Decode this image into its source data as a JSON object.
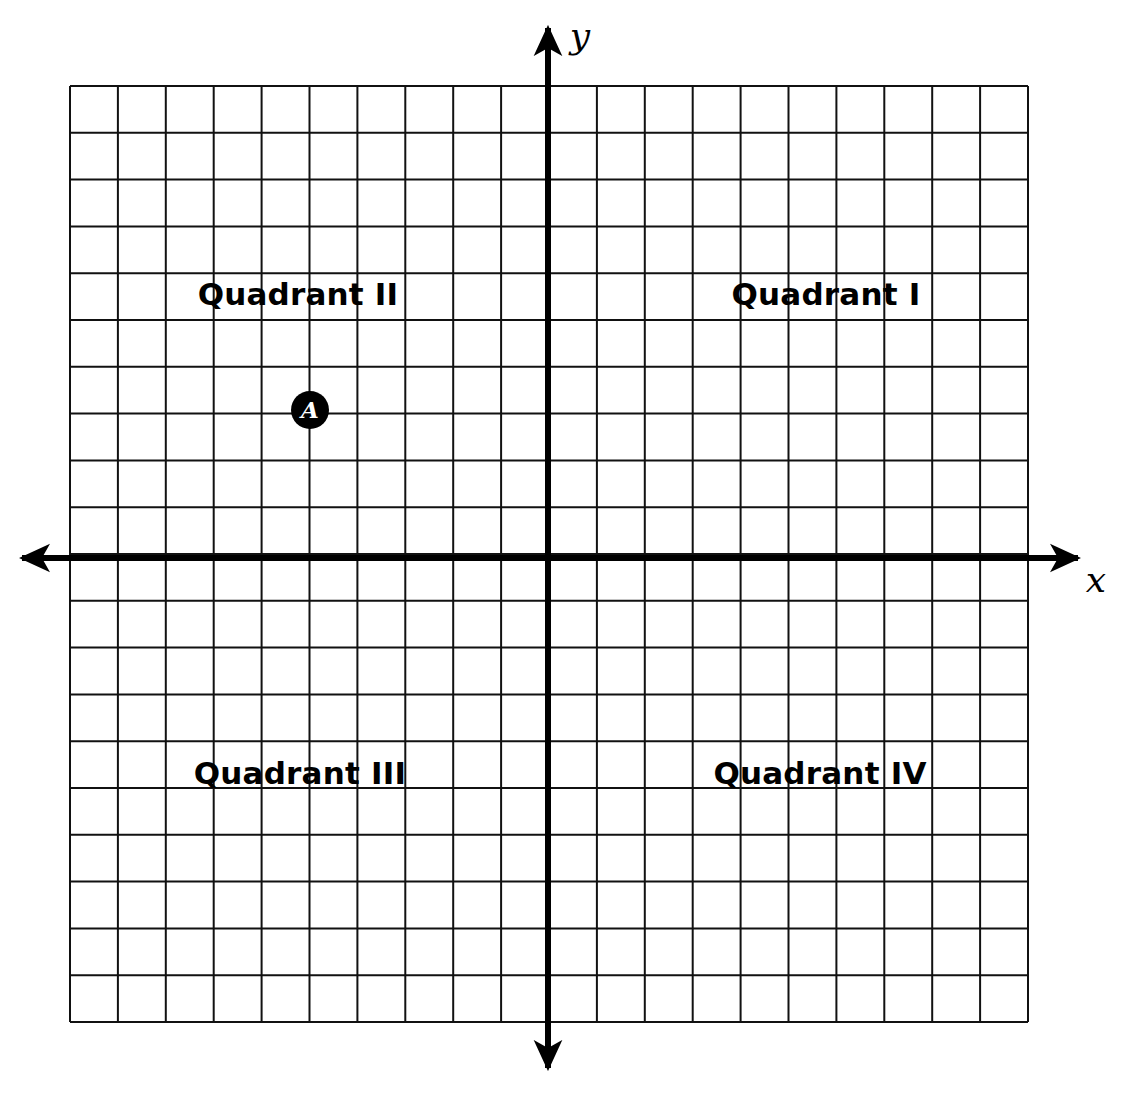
{
  "figure": {
    "type": "coordinate-plane",
    "background_color": "#ffffff",
    "ink_color": "#000000",
    "grid": {
      "left_px": 70,
      "top_px": 86,
      "right_px": 1028,
      "bottom_px": 1022,
      "columns": 20,
      "rows": 20,
      "cell_width_px": 47.9,
      "cell_height_px": 46.8,
      "line_width_px": 2,
      "line_color": "#111111"
    },
    "axes": {
      "origin_x_px": 548,
      "origin_y_px": 558,
      "line_width_px": 6,
      "color": "#000000",
      "x_axis": {
        "label": "x",
        "label_x_px": 1096,
        "label_y_px": 580,
        "left_arrow_tip_px": 22,
        "right_arrow_tip_px": 1078
      },
      "y_axis": {
        "label": "y",
        "label_x_px": 580,
        "label_y_px": 36,
        "top_arrow_tip_px": 28,
        "bottom_arrow_tip_px": 1068
      }
    }
  },
  "quadrant_labels": [
    {
      "name": "quadrant-1",
      "text": "Quadrant I",
      "x_px": 826,
      "y_px": 294,
      "grid_x": 5.8,
      "grid_y": 5.6
    },
    {
      "name": "quadrant-2",
      "text": "Quadrant II",
      "x_px": 298,
      "y_px": 294,
      "grid_x": -5.2,
      "grid_y": 5.6
    },
    {
      "name": "quadrant-3",
      "text": "Quadrant III",
      "x_px": 300,
      "y_px": 773,
      "grid_x": -5.2,
      "grid_y": -4.6
    },
    {
      "name": "quadrant-4",
      "text": "Quadrant IV",
      "x_px": 820,
      "y_px": 773,
      "grid_x": 5.7,
      "grid_y": -4.6
    }
  ],
  "points": [
    {
      "name": "point-a",
      "label": "A",
      "x_px": 310,
      "y_px": 410,
      "grid_x": -5,
      "grid_y": 3,
      "radius_px": 19,
      "fill": "#000000",
      "label_color": "#ffffff"
    }
  ],
  "chart_data": {
    "type": "scatter",
    "title": "",
    "xlabel": "x",
    "ylabel": "y",
    "xlim": [
      -10,
      10
    ],
    "ylim": [
      -10,
      10
    ],
    "grid": true,
    "legend": "none",
    "annotations": [
      "Quadrant I",
      "Quadrant II",
      "Quadrant III",
      "Quadrant IV"
    ],
    "points": [
      {
        "label": "A",
        "x": -5,
        "y": 3,
        "quadrant": "II"
      }
    ]
  }
}
